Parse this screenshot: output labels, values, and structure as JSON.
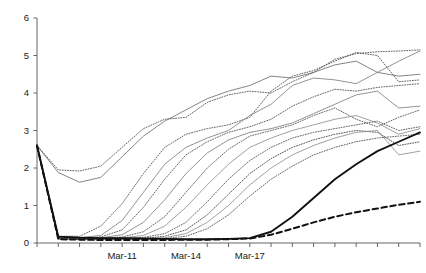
{
  "chart_data": {
    "type": "line",
    "title": "",
    "subtitle": "",
    "xlabel": "",
    "ylabel": "",
    "ylim": [
      0,
      6
    ],
    "yticks": [
      0,
      1,
      2,
      3,
      4,
      5,
      6
    ],
    "ytick_labels": [
      "0",
      "1",
      "2",
      "3",
      "4",
      "5",
      "6"
    ],
    "grid": false,
    "legend_position": "none",
    "legend_entries": [],
    "annotations": [],
    "axis_color": "#555555",
    "background_color": "#ffffff",
    "x": [
      "Mar-07",
      "Mar-08",
      "Mar-09",
      "Mar-10",
      "Mar-11",
      "Mar-12",
      "Mar-13",
      "Mar-14",
      "Mar-15",
      "Mar-16",
      "Mar-17",
      "Mar-18",
      "Mar-19",
      "Mar-20",
      "Mar-21",
      "Mar-22",
      "Mar-23",
      "Mar-24",
      "Mar-25"
    ],
    "xtick_labels": [
      "",
      "",
      "",
      "",
      "Mar-11",
      "",
      "",
      "Mar-14",
      "",
      "",
      "Mar-17",
      "",
      "",
      "",
      "",
      "",
      "",
      "",
      ""
    ],
    "xtick_labeled": [
      "Mar-11",
      "Mar-14",
      "Mar-17"
    ],
    "xtick_count": 19,
    "series": [
      {
        "name": "series-1",
        "style": "dotted",
        "color": "#555555",
        "width": 0.9,
        "values": [
          2.6,
          1.95,
          1.92,
          2.05,
          2.55,
          3.05,
          3.3,
          3.35,
          3.75,
          3.95,
          4.05,
          4.0,
          4.3,
          4.55,
          4.9,
          5.05,
          5.1,
          5.12,
          5.15
        ]
      },
      {
        "name": "series-2",
        "style": "solid-thin",
        "color": "#666666",
        "width": 0.8,
        "values": [
          2.6,
          1.88,
          1.62,
          1.75,
          2.3,
          2.85,
          3.25,
          3.55,
          3.85,
          4.05,
          4.2,
          4.45,
          4.4,
          4.55,
          4.75,
          4.85,
          4.55,
          4.45,
          4.5
        ]
      },
      {
        "name": "series-3",
        "style": "dotted",
        "color": "#555555",
        "width": 0.9,
        "values": [
          2.6,
          0.18,
          0.18,
          0.45,
          1.05,
          1.85,
          2.55,
          2.9,
          3.05,
          3.15,
          3.35,
          4.05,
          4.45,
          4.6,
          4.85,
          5.08,
          5.0,
          4.3,
          4.35
        ]
      },
      {
        "name": "series-4",
        "style": "solid-thin",
        "color": "#777777",
        "width": 0.8,
        "values": [
          2.6,
          0.18,
          0.15,
          0.2,
          0.6,
          1.35,
          2.1,
          2.55,
          2.8,
          3.0,
          3.4,
          3.7,
          4.2,
          4.4,
          4.35,
          4.25,
          4.55,
          4.85,
          5.12
        ]
      },
      {
        "name": "series-5",
        "style": "dotted",
        "color": "#555555",
        "width": 0.9,
        "values": [
          2.6,
          0.16,
          0.14,
          0.16,
          0.35,
          0.95,
          1.7,
          2.35,
          2.7,
          2.95,
          3.1,
          3.3,
          3.65,
          3.9,
          4.1,
          4.05,
          4.15,
          4.2,
          4.25
        ]
      },
      {
        "name": "series-6",
        "style": "solid-thin",
        "color": "#777777",
        "width": 0.8,
        "values": [
          2.6,
          0.15,
          0.13,
          0.14,
          0.22,
          0.55,
          1.15,
          1.85,
          2.4,
          2.75,
          2.95,
          3.05,
          3.2,
          3.45,
          3.7,
          3.95,
          4.05,
          3.6,
          3.65
        ]
      },
      {
        "name": "series-7",
        "style": "dotted",
        "color": "#555555",
        "width": 0.9,
        "values": [
          2.6,
          0.14,
          0.12,
          0.13,
          0.16,
          0.3,
          0.7,
          1.35,
          2.0,
          2.5,
          2.85,
          3.0,
          3.15,
          3.4,
          3.6,
          3.3,
          3.1,
          3.35,
          3.55
        ]
      },
      {
        "name": "series-8",
        "style": "solid-thin",
        "color": "#888888",
        "width": 0.8,
        "values": [
          2.6,
          0.13,
          0.11,
          0.12,
          0.14,
          0.2,
          0.45,
          0.95,
          1.55,
          2.1,
          2.55,
          2.8,
          3.0,
          3.15,
          3.3,
          3.4,
          3.2,
          2.9,
          3.05
        ]
      },
      {
        "name": "series-9",
        "style": "dotted",
        "color": "#555555",
        "width": 0.9,
        "values": [
          2.6,
          0.12,
          0.1,
          0.11,
          0.12,
          0.15,
          0.25,
          0.55,
          1.1,
          1.7,
          2.2,
          2.55,
          2.8,
          2.95,
          3.05,
          3.15,
          3.25,
          3.0,
          3.1
        ]
      },
      {
        "name": "series-10",
        "style": "dotted",
        "color": "#444444",
        "width": 0.9,
        "values": [
          2.6,
          0.12,
          0.1,
          0.1,
          0.11,
          0.12,
          0.18,
          0.35,
          0.75,
          1.3,
          1.85,
          2.25,
          2.55,
          2.75,
          2.9,
          3.0,
          2.95,
          2.6,
          2.7
        ]
      },
      {
        "name": "series-11",
        "style": "solid-thin",
        "color": "#888888",
        "width": 0.8,
        "values": [
          2.6,
          0.11,
          0.09,
          0.1,
          0.1,
          0.11,
          0.14,
          0.25,
          0.55,
          1.0,
          1.55,
          2.0,
          2.35,
          2.6,
          2.8,
          2.95,
          3.0,
          2.35,
          2.45
        ]
      },
      {
        "name": "series-12",
        "style": "dotted",
        "color": "#555555",
        "width": 0.9,
        "values": [
          2.6,
          0.11,
          0.09,
          0.09,
          0.1,
          0.1,
          0.12,
          0.18,
          0.38,
          0.75,
          1.25,
          1.7,
          2.05,
          2.35,
          2.55,
          2.7,
          2.8,
          2.85,
          2.9
        ]
      },
      {
        "name": "series-13",
        "style": "solid-thick",
        "color": "#111111",
        "width": 1.9,
        "values": [
          2.6,
          0.17,
          0.14,
          0.13,
          0.13,
          0.12,
          0.11,
          0.1,
          0.1,
          0.11,
          0.13,
          0.3,
          0.7,
          1.2,
          1.7,
          2.1,
          2.45,
          2.7,
          2.95
        ]
      },
      {
        "name": "series-14",
        "style": "dashed-thick",
        "color": "#111111",
        "width": 2.0,
        "values": [
          2.6,
          0.1,
          0.09,
          0.08,
          0.08,
          0.08,
          0.08,
          0.09,
          0.09,
          0.1,
          0.12,
          0.22,
          0.38,
          0.55,
          0.7,
          0.82,
          0.92,
          1.02,
          1.1
        ]
      }
    ]
  }
}
